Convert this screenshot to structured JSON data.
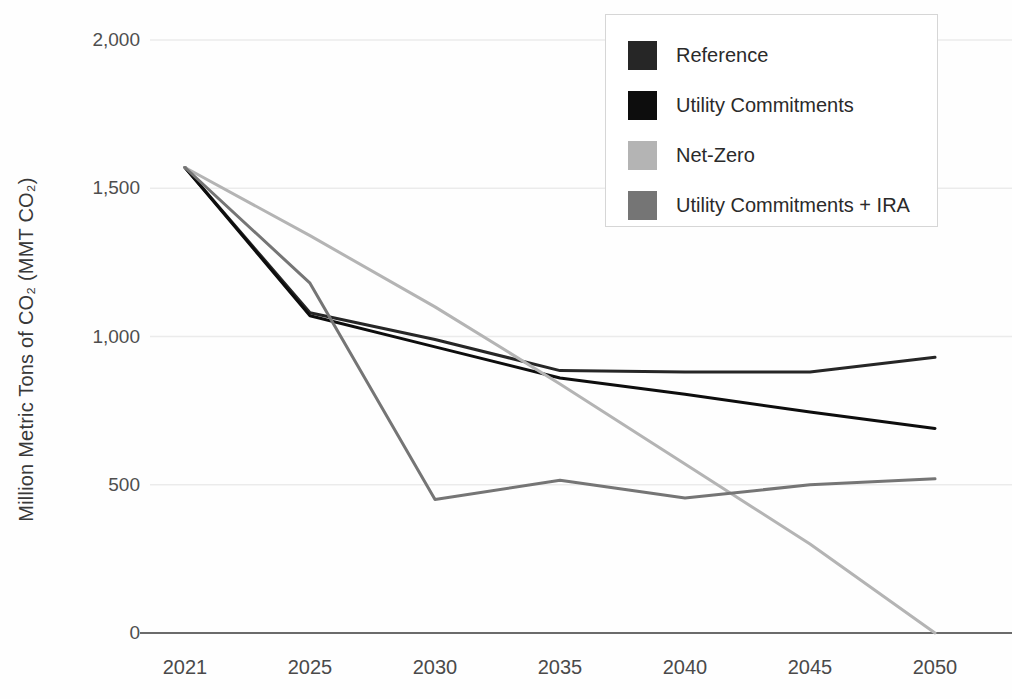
{
  "page": {
    "background_color": "#ffffff"
  },
  "chart_data": {
    "type": "line",
    "title": "",
    "xlabel": "",
    "ylabel": "Million Metric Tons of CO₂ (MMT CO₂)",
    "ylim": [
      0,
      2000
    ],
    "grid": "horizontal gridlines at 500-unit intervals, grid on",
    "legend_position": "top-right box with border",
    "grid_color": "#ebebeb",
    "axis_color": "#6b6b6b",
    "tick_text_color": "#4e4e4e",
    "categories": [
      "2021",
      "2025",
      "2030",
      "2035",
      "2040",
      "2045",
      "2050"
    ],
    "y_ticks": [
      {
        "value": 0,
        "label": "0"
      },
      {
        "value": 500,
        "label": "500"
      },
      {
        "value": 1000,
        "label": "1,000"
      },
      {
        "value": 1500,
        "label": "1,500"
      },
      {
        "value": 2000,
        "label": "2,000"
      }
    ],
    "series": [
      {
        "name": "Reference",
        "color": "#262626",
        "values": [
          1570,
          1080,
          990,
          885,
          880,
          880,
          930
        ]
      },
      {
        "name": "Utility Commitments",
        "color": "#0d0d0d",
        "values": [
          1570,
          1070,
          965,
          860,
          805,
          745,
          690
        ]
      },
      {
        "name": "Net-Zero",
        "color": "#b4b4b4",
        "values": [
          1570,
          1340,
          1100,
          840,
          570,
          300,
          0
        ]
      },
      {
        "name": "Utility Commitments + IRA",
        "color": "#757575",
        "values": [
          1570,
          1180,
          450,
          515,
          455,
          500,
          520
        ]
      }
    ]
  }
}
